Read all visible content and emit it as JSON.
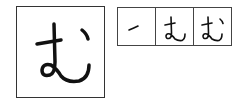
{
  "character": {
    "glyph": "む",
    "romaji": "mu",
    "script": "hiragana"
  },
  "stroke_order": {
    "steps": [
      {
        "step": 1,
        "label": "stroke 1"
      },
      {
        "step": 2,
        "label": "strokes 1-2"
      },
      {
        "step": 3,
        "label": "strokes 1-3 (complete)"
      }
    ]
  },
  "colors": {
    "ink": "#111111",
    "border": "#333333",
    "background": "#ffffff"
  }
}
